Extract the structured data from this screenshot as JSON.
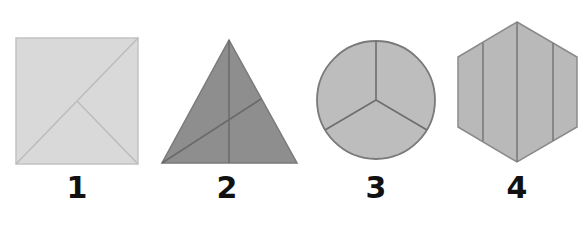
{
  "figure": {
    "shapes": [
      {
        "id": 1,
        "label": "1",
        "type": "square",
        "fill": "#d9d9d9",
        "stroke": "#b8b8b8",
        "parts": 3
      },
      {
        "id": 2,
        "label": "2",
        "type": "triangle",
        "fill": "#8e8e8e",
        "stroke": "#6f6f6f",
        "parts": 3
      },
      {
        "id": 3,
        "label": "3",
        "type": "circle",
        "fill": "#bdbdbd",
        "stroke": "#7a7a7a",
        "parts": 3
      },
      {
        "id": 4,
        "label": "4",
        "type": "hexagon",
        "fill": "#b9b9b9",
        "stroke": "#7d7d7d",
        "parts": 4
      }
    ]
  }
}
